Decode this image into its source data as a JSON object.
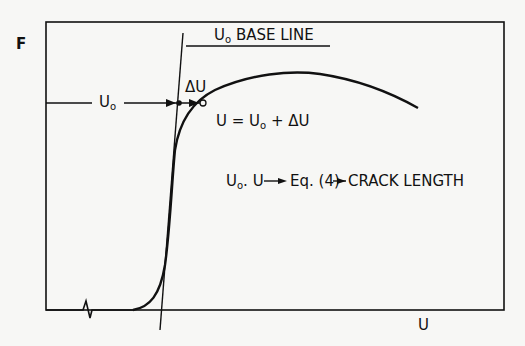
{
  "diagram": {
    "y_axis_label": "F",
    "x_axis_label": "U",
    "baseline_label": {
      "main": "U",
      "sub": "o",
      "rest": " BASE LINE"
    },
    "u0_label": {
      "main": "U",
      "sub": "o"
    },
    "delta_u_label": "ΔU",
    "equation": {
      "lhs": "U = U",
      "sub": "o",
      "rhs": "+ ΔU"
    },
    "flow": {
      "a": "U",
      "a_sub": "o",
      "b": ". U",
      "arrow1": "→",
      "eq": "Eq. (4)",
      "arrow2": "→",
      "result": "CRACK LENGTH"
    },
    "colors": {
      "ink": "#111111",
      "paper": "#f7f7f5"
    }
  }
}
